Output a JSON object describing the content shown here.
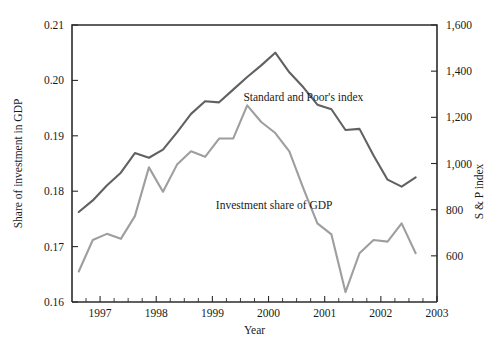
{
  "chart_data": {
    "type": "line",
    "title": "",
    "xlabel": "Year",
    "ylabel": "Share of investment in GDP",
    "y2label": "S & P index",
    "xlim": [
      1996.5,
      2003.0
    ],
    "ylim": [
      0.16,
      0.21
    ],
    "y2lim": [
      400,
      1600
    ],
    "grid": false,
    "legend_position": "inline-annotations",
    "xticks": [
      "1997",
      "1998",
      "1999",
      "2000",
      "2001",
      "2002",
      "2003"
    ],
    "xtick_values": [
      1997,
      1998,
      1999,
      2000,
      2001,
      2002,
      2003
    ],
    "xminor_per_interval": 3,
    "yticks": [
      "0.16",
      "0.17",
      "0.18",
      "0.19",
      "0.20",
      "0.21"
    ],
    "ytick_values": [
      0.16,
      0.17,
      0.18,
      0.19,
      0.2,
      0.21
    ],
    "y2ticks": [
      "600",
      "800",
      "1,000",
      "1,200",
      "1,400",
      "1,600"
    ],
    "y2tick_values": [
      600,
      800,
      1000,
      1200,
      1400,
      1600
    ],
    "series": [
      {
        "name": "Standard and Poor's index",
        "axis": "right",
        "color": "#616161",
        "label_x": 2000.62,
        "label_y": 1272,
        "x": [
          1996.62,
          1996.87,
          1997.12,
          1997.37,
          1997.62,
          1997.87,
          1998.12,
          1998.37,
          1998.62,
          1998.87,
          1999.12,
          1999.37,
          1999.62,
          1999.87,
          2000.12,
          2000.37,
          2000.62,
          2000.87,
          2001.12,
          2001.37,
          2001.62,
          2001.87,
          2002.12,
          2002.37,
          2002.62
        ],
        "y": [
          790,
          840,
          905,
          960,
          1045,
          1025,
          1060,
          1135,
          1215,
          1270,
          1265,
          1320,
          1375,
          1425,
          1480,
          1395,
          1330,
          1255,
          1235,
          1145,
          1150,
          1035,
          930,
          900,
          940
        ]
      },
      {
        "name": "Investment share of GDP",
        "axis": "left",
        "color": "#9e9e9e",
        "label_x": 2000.1,
        "label_y": 805,
        "x": [
          1996.62,
          1996.87,
          1997.12,
          1997.37,
          1997.62,
          1997.87,
          1998.12,
          1998.37,
          1998.62,
          1998.87,
          1999.12,
          1999.37,
          1999.62,
          1999.87,
          2000.12,
          2000.37,
          2000.62,
          2000.87,
          2001.12,
          2001.37,
          2001.62,
          2001.87,
          2002.12,
          2002.37,
          2002.62
        ],
        "y": [
          0.1655,
          0.1712,
          0.1723,
          0.1714,
          0.1755,
          0.1843,
          0.1799,
          0.1848,
          0.1872,
          0.1862,
          0.1895,
          0.1895,
          0.1955,
          0.1925,
          0.1905,
          0.1872,
          0.1805,
          0.1742,
          0.1722,
          0.1618,
          0.1688,
          0.1712,
          0.1709,
          0.1742,
          0.1688
        ]
      }
    ]
  },
  "layout": {
    "plot_left": 72,
    "plot_right": 437,
    "plot_top": 25,
    "plot_bottom": 302
  }
}
